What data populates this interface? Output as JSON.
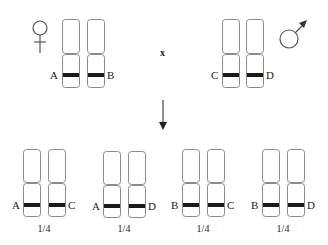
{
  "diagram": {
    "type": "genetic-cross",
    "parents": {
      "female": {
        "symbol": "female-symbol",
        "alleles": [
          "A",
          "B"
        ]
      },
      "male": {
        "symbol": "male-symbol",
        "alleles": [
          "C",
          "D"
        ]
      },
      "cross_symbol": "x"
    },
    "offspring": [
      {
        "left": "A",
        "right": "C",
        "ratio": "1/4"
      },
      {
        "left": "A",
        "right": "D",
        "ratio": "1/4"
      },
      {
        "left": "B",
        "right": "C",
        "ratio": "1/4"
      },
      {
        "left": "B",
        "right": "D",
        "ratio": "1/4"
      }
    ],
    "colors": {
      "band": "#1a1a1a",
      "outline": "#8a8a8a",
      "text": "#222222"
    }
  }
}
